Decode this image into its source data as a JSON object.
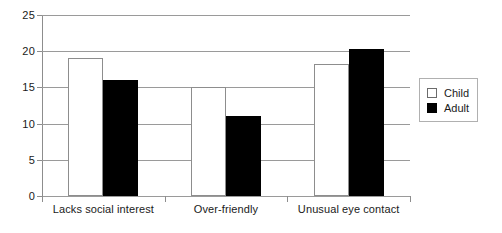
{
  "chart_data": {
    "type": "bar",
    "title": "",
    "xlabel": "",
    "ylabel": "",
    "ylim": [
      0,
      25
    ],
    "yticks": [
      0,
      5,
      10,
      15,
      20,
      25
    ],
    "ytick_labels": [
      "0",
      "5",
      "10",
      "15",
      "20",
      "25"
    ],
    "grid": true,
    "legend_position": "right",
    "categories": [
      "Lacks social interest",
      "Over-friendly",
      "Unusual eye contact"
    ],
    "series": [
      {
        "name": "Child",
        "color": "#ffffff",
        "values": [
          19.0,
          15.0,
          18.3
        ]
      },
      {
        "name": "Adult",
        "color": "#000000",
        "values": [
          16.0,
          11.1,
          20.3
        ]
      }
    ]
  },
  "legend": {
    "entries": [
      {
        "label": "Child"
      },
      {
        "label": "Adult"
      }
    ]
  }
}
